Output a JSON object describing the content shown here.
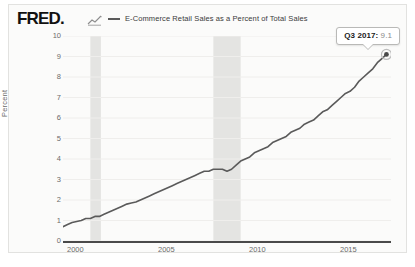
{
  "header": {
    "logo_text": "FRED",
    "logo_dot": ".",
    "squiggle_icon": "chart-squiggle-icon"
  },
  "legend": {
    "label": "E-Commerce Retail Sales as a Percent of Total Sales",
    "line_color": "#5a5a5a"
  },
  "tooltip": {
    "date": "Q3 2017:",
    "value": "9.1"
  },
  "axes": {
    "y_title": "Percent",
    "y_ticks": [
      "10",
      "9",
      "8",
      "7",
      "6",
      "5",
      "4",
      "3",
      "2",
      "1",
      "0"
    ],
    "x_ticks": [
      "2000",
      "2005",
      "2010",
      "2015"
    ]
  },
  "colors": {
    "line": "#5a5a5a",
    "recession_band": "#e4e4e2",
    "gridline": "#efeeec",
    "axis_text": "#6b6b6b",
    "panel_background": "#fbfbfa",
    "panel_border": "#e2e2e0",
    "marker_fill": "#4a4a4a"
  },
  "chart_data": {
    "type": "line",
    "title": "E-Commerce Retail Sales as a Percent of Total Sales",
    "xlabel": "",
    "ylabel": "Percent",
    "xlim": [
      1999.75,
      2017.75
    ],
    "ylim": [
      0,
      10
    ],
    "grid": true,
    "legend_position": "top",
    "series": [
      {
        "name": "E-Commerce Retail Sales as a Percent of Total Sales",
        "color": "#5a5a5a",
        "x": [
          1999.75,
          2000.0,
          2000.25,
          2000.5,
          2000.75,
          2001.0,
          2001.25,
          2001.5,
          2001.75,
          2002.0,
          2002.25,
          2002.5,
          2002.75,
          2003.0,
          2003.25,
          2003.5,
          2003.75,
          2004.0,
          2004.25,
          2004.5,
          2004.75,
          2005.0,
          2005.25,
          2005.5,
          2005.75,
          2006.0,
          2006.25,
          2006.5,
          2006.75,
          2007.0,
          2007.25,
          2007.5,
          2007.75,
          2008.0,
          2008.25,
          2008.5,
          2008.75,
          2009.0,
          2009.25,
          2009.5,
          2009.75,
          2010.0,
          2010.25,
          2010.5,
          2010.75,
          2011.0,
          2011.25,
          2011.5,
          2011.75,
          2012.0,
          2012.25,
          2012.5,
          2012.75,
          2013.0,
          2013.25,
          2013.5,
          2013.75,
          2014.0,
          2014.25,
          2014.5,
          2014.75,
          2015.0,
          2015.25,
          2015.5,
          2015.75,
          2016.0,
          2016.25,
          2016.5,
          2016.75,
          2017.0,
          2017.25,
          2017.5
        ],
        "y": [
          0.7,
          0.8,
          0.9,
          0.95,
          1.0,
          1.1,
          1.1,
          1.2,
          1.2,
          1.3,
          1.4,
          1.5,
          1.6,
          1.7,
          1.8,
          1.85,
          1.9,
          2.0,
          2.1,
          2.2,
          2.3,
          2.4,
          2.5,
          2.6,
          2.7,
          2.8,
          2.9,
          3.0,
          3.1,
          3.2,
          3.3,
          3.4,
          3.4,
          3.5,
          3.5,
          3.5,
          3.4,
          3.5,
          3.7,
          3.9,
          4.0,
          4.1,
          4.3,
          4.4,
          4.5,
          4.6,
          4.8,
          4.9,
          5.0,
          5.1,
          5.3,
          5.4,
          5.5,
          5.7,
          5.8,
          5.9,
          6.1,
          6.3,
          6.4,
          6.6,
          6.8,
          7.0,
          7.2,
          7.3,
          7.5,
          7.8,
          8.0,
          8.2,
          8.4,
          8.7,
          8.9,
          9.1
        ]
      }
    ],
    "recession_bands": [
      {
        "start": 2001.25,
        "end": 2001.83
      },
      {
        "start": 2008.0,
        "end": 2009.5
      }
    ],
    "highlight_point": {
      "x": 2017.5,
      "y": 9.1,
      "label": "Q3 2017: 9.1"
    }
  }
}
